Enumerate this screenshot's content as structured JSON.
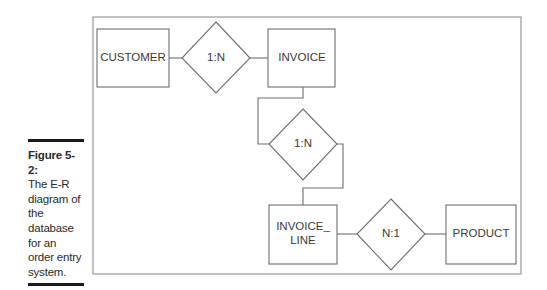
{
  "caption": {
    "figure_label": "Figure 5-2:",
    "text": "The E-R diagram of the database for an order entry system."
  },
  "entities": {
    "customer": "CUSTOMER",
    "invoice": "INVOICE",
    "invoice_line_1": "INVOICE_",
    "invoice_line_2": "LINE",
    "product": "PRODUCT"
  },
  "relationships": {
    "customer_invoice": "1:N",
    "invoice_invoice_line": "1:N",
    "invoice_line_product": "N:1"
  }
}
